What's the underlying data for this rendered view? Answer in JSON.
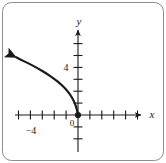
{
  "figure": {
    "border_color": "#8d8d8d",
    "background": "#ffffff",
    "width": 166,
    "height": 163
  },
  "labels": {
    "x_axis": "x",
    "y_axis": "y",
    "origin": "0",
    "x_tick_label": "−4",
    "y_tick_label": "4"
  },
  "chart_data": {
    "type": "line",
    "title": "",
    "xlabel": "x",
    "ylabel": "y",
    "xlim": [
      -5.5,
      6.0
    ],
    "ylim": [
      -3.0,
      6.5
    ],
    "grid": false,
    "legend": null,
    "axis_arrows": [
      "x-positive",
      "y-positive"
    ],
    "x_ticks": [
      -5,
      -4,
      -3,
      -2,
      -1,
      1,
      2,
      3,
      4,
      5
    ],
    "y_ticks": [
      -2,
      -1,
      1,
      2,
      3,
      4,
      5,
      6
    ],
    "x_tick_labels": [
      {
        "value": -4,
        "text": "−4"
      }
    ],
    "y_tick_labels": [
      {
        "value": 4,
        "text": "4"
      }
    ],
    "origin_label": "0",
    "series": [
      {
        "name": "curve",
        "color": "#1a1a1a",
        "line_width": 2.2,
        "arrow_end": "start",
        "closed_point_at": [
          0,
          0
        ],
        "description": "Reflected logarithmic curve through the origin, increasing as x decreases, with an arrowhead at the upper-left end",
        "points": [
          [
            0.0,
            0.0
          ],
          [
            -0.12,
            0.55
          ],
          [
            -0.28,
            1.0
          ],
          [
            -0.5,
            1.45
          ],
          [
            -0.8,
            1.9
          ],
          [
            -1.2,
            2.35
          ],
          [
            -1.7,
            2.8
          ],
          [
            -2.3,
            3.25
          ],
          [
            -3.0,
            3.7
          ],
          [
            -3.8,
            4.15
          ],
          [
            -4.6,
            4.55
          ],
          [
            -5.2,
            4.85
          ]
        ]
      }
    ]
  }
}
